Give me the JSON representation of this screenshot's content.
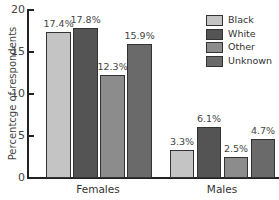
{
  "chart_data": {
    "type": "bar",
    "title": "",
    "xlabel": "",
    "ylabel": "Percentcge of respondents",
    "ylim": [
      0,
      20
    ],
    "yticks": [
      0,
      5,
      10,
      15,
      20
    ],
    "ytick_labels": [
      "0",
      "5",
      "10",
      "15",
      "20"
    ],
    "categories": [
      "Females",
      "Males"
    ],
    "series": [
      {
        "name": "Black",
        "color": "#c4c4c4",
        "values": [
          17.4,
          3.3
        ],
        "labels": [
          "17.4%",
          "3.3%"
        ]
      },
      {
        "name": "White",
        "color": "#545454",
        "values": [
          17.8,
          6.1
        ],
        "labels": [
          "17.8%",
          "6.1%"
        ]
      },
      {
        "name": "Other",
        "color": "#8c8c8c",
        "values": [
          12.3,
          2.5
        ],
        "labels": [
          "12.3%",
          "2.5%"
        ]
      },
      {
        "name": "Unknown",
        "color": "#6a6a6a",
        "values": [
          15.9,
          4.7
        ],
        "labels": [
          "15.9%",
          "4.7%"
        ]
      }
    ],
    "legend_position": "top-right",
    "grid": false
  }
}
